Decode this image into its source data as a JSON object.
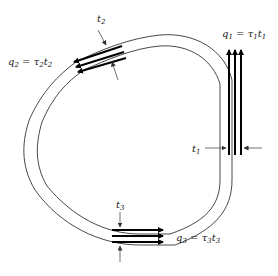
{
  "labels": {
    "t1": {
      "sym": "t",
      "sub": "1"
    },
    "t2": {
      "sym": "t",
      "sub": "2"
    },
    "t3": {
      "sym": "t",
      "sub": "3"
    },
    "q1": {
      "lhs": "q",
      "lhs_sub": "1",
      "eq": " = ",
      "tau": "τ",
      "tau_sub": "1",
      "t": "t",
      "t_sub": "1"
    },
    "q2": {
      "lhs": "q",
      "lhs_sub": "2",
      "eq": " = ",
      "tau": "τ",
      "tau_sub": "2",
      "t": "t",
      "t_sub": "2"
    },
    "q3": {
      "lhs": "q",
      "lhs_sub": "3",
      "eq": " = ",
      "tau": "τ",
      "tau_sub": "3",
      "t": "t",
      "t_sub": "3"
    }
  },
  "colors": {
    "line": "#333333",
    "arrow": "#000000",
    "text": "#222222"
  }
}
